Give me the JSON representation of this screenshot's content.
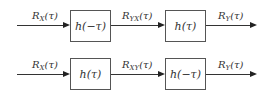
{
  "diagram": {
    "rows": [
      {
        "input": {
          "main": "R",
          "sub": "X",
          "arg": "(τ)"
        },
        "block1": "h(−τ)",
        "middle": {
          "main": "R",
          "sub": "YX",
          "arg": "(τ)"
        },
        "block2": "h(τ)",
        "output": {
          "main": "R",
          "sub": "Y",
          "arg": "(τ)"
        }
      },
      {
        "input": {
          "main": "R",
          "sub": "X",
          "arg": "(τ)"
        },
        "block1": "h(τ)",
        "middle": {
          "main": "R",
          "sub": "XY",
          "arg": "(τ)"
        },
        "block2": "h(−τ)",
        "output": {
          "main": "R",
          "sub": "Y",
          "arg": "(τ)"
        }
      }
    ]
  }
}
